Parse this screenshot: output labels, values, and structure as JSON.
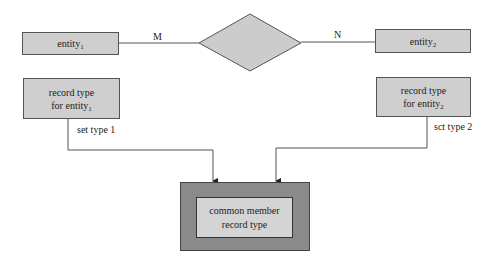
{
  "diagram": {
    "entities": [
      {
        "id": "entity1",
        "name": "entity",
        "subscript": "1",
        "cardinality": "M"
      },
      {
        "id": "entity2",
        "name": "entity",
        "subscript": "2",
        "cardinality": "N"
      }
    ],
    "relationship": {
      "shape": "diamond",
      "label": ""
    },
    "record_types": [
      {
        "line1": "record type",
        "line2": "for entity",
        "subscript": "1",
        "set_label": "set type 1"
      },
      {
        "line1": "record type",
        "line2": "for entity",
        "subscript": "2",
        "set_label": "sct type 2"
      }
    ],
    "member": {
      "line1": "common member",
      "line2": "record type"
    },
    "colors": {
      "box_fill": "#cfcfcf",
      "outer_fill": "#8a8a8a",
      "inner_fill": "#d4d4d4",
      "diamond_fill": "#cccccc",
      "line": "#555555"
    }
  }
}
